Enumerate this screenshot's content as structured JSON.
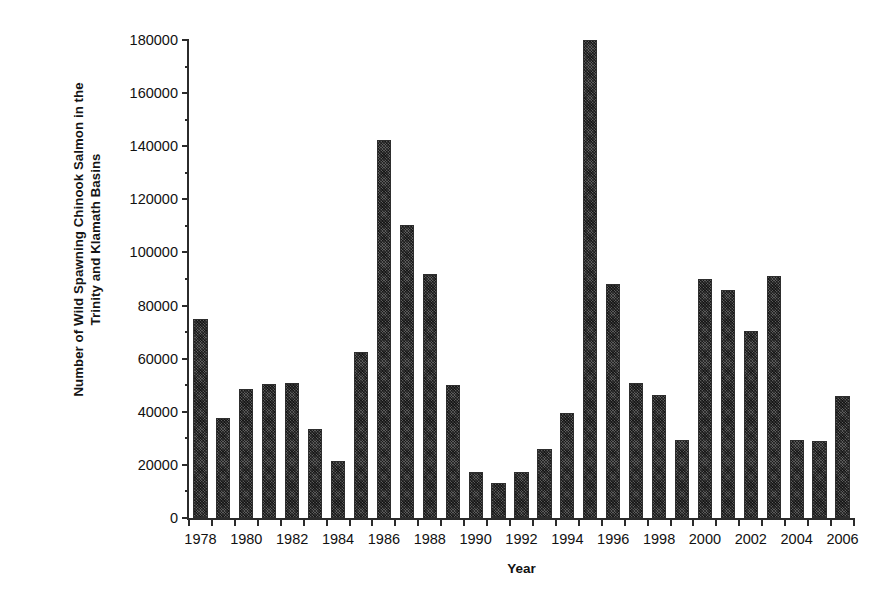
{
  "chart_data": {
    "type": "bar",
    "title": "",
    "xlabel": "Year",
    "ylabel": "Number of  Wild Spawning Chinook Salmon in the\nTrinity and Klamath Basins",
    "ylim": [
      0,
      180000
    ],
    "ytick_step": 20000,
    "yminor_step": 10000,
    "grid": false,
    "legend": null,
    "xtick_labels": [
      "1978",
      "1980",
      "1982",
      "1984",
      "1986",
      "1988",
      "1990",
      "1992",
      "1994",
      "1996",
      "1998",
      "2000",
      "2002",
      "2004",
      "2006"
    ],
    "ytick_labels": [
      "0",
      "20000",
      "40000",
      "60000",
      "80000",
      "100000",
      "120000",
      "140000",
      "160000",
      "180000"
    ],
    "bar_color": "#5a5a5a",
    "bar_edge_color": "#2e2e2e",
    "categories": [
      "1978",
      "1979",
      "1980",
      "1981",
      "1982",
      "1983",
      "1984",
      "1985",
      "1986",
      "1987",
      "1988",
      "1989",
      "1990",
      "1991",
      "1992",
      "1993",
      "1994",
      "1995",
      "1996",
      "1997",
      "1998",
      "1999",
      "2000",
      "2001",
      "2002",
      "2003",
      "2004",
      "2005",
      "2006"
    ],
    "values": [
      75000,
      37500,
      48500,
      50500,
      51000,
      33500,
      21500,
      62500,
      142500,
      110500,
      92000,
      50000,
      17500,
      13000,
      17500,
      26000,
      39500,
      180000,
      88000,
      51000,
      46500,
      29500,
      90000,
      86000,
      70500,
      91000,
      29500,
      29000,
      46000
    ]
  }
}
